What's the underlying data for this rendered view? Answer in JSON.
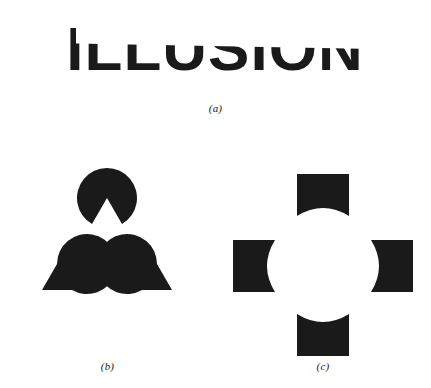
{
  "figure": {
    "background_color": "#ffffff",
    "ink_color": "#1a1a1a",
    "panels": [
      {
        "key": "a",
        "caption": "(a)",
        "kind": "occluded-word",
        "word": "ILLUSION",
        "description": "The word ILLUSION interrupted by a blank diagonal band that is perceived as an occluding surface."
      },
      {
        "key": "b",
        "caption": "(b)",
        "kind": "kanizsa-triangle",
        "description": "Three notched discs (pac-man inducers) arranged at the vertices of an equilateral triangle produce an illusory white triangle.",
        "inducers": [
          {
            "name": "top-disc",
            "cx": 107,
            "cy": 38,
            "r": 30,
            "wedge_start_deg": 60,
            "wedge_end_deg": 120
          },
          {
            "name": "bottom-left-disc",
            "cx": 42,
            "cy": 130,
            "r": 30,
            "wedge_start_deg": -60,
            "wedge_end_deg": 0
          },
          {
            "name": "bottom-right-disc",
            "cx": 172,
            "cy": 130,
            "r": 30,
            "wedge_start_deg": 180,
            "wedge_end_deg": 240
          }
        ]
      },
      {
        "key": "c",
        "caption": "(c)",
        "kind": "illusory-circle",
        "description": "Four squares with concave inner edges arranged around a centre produce an illusory white circle.",
        "inducers": [
          {
            "name": "top-square",
            "x": 82,
            "y": 14,
            "w": 52,
            "h": 42,
            "concave_edge": "bottom"
          },
          {
            "name": "left-square",
            "x": 18,
            "y": 80,
            "w": 42,
            "h": 52,
            "concave_edge": "right"
          },
          {
            "name": "right-square",
            "x": 156,
            "y": 80,
            "w": 42,
            "h": 52,
            "concave_edge": "left"
          },
          {
            "name": "bottom-square",
            "x": 82,
            "y": 154,
            "w": 52,
            "h": 42,
            "concave_edge": "top"
          }
        ]
      }
    ]
  }
}
